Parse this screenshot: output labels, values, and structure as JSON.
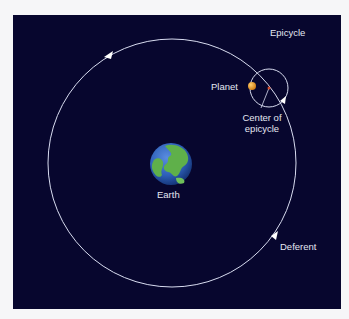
{
  "diagram": {
    "type": "Ptolemaic epicycle model",
    "labels": {
      "epicycle": "Epicycle",
      "planet": "Planet",
      "center_of_epicycle_line1": "Center of",
      "center_of_epicycle_line2": "epicycle",
      "earth": "Earth",
      "deferent": "Deferent"
    },
    "colors": {
      "background": "#07062e",
      "page": "#f6f6f8",
      "orbit_line": "#d8dcf0",
      "planet": "#e8961e",
      "epicycle_center": "#d04a2a",
      "earth_ocean": "#2d5fb8",
      "earth_land": "#5fb04a"
    },
    "motion_direction": "counter-clockwise"
  }
}
